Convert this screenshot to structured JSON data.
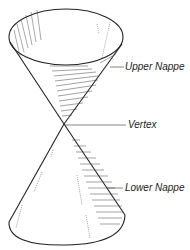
{
  "figure": {
    "labels": {
      "upper_nappe": "Upper Nappe",
      "vertex": "Vertex",
      "lower_nappe": "Lower Nappe"
    },
    "colors": {
      "ink": "#222222",
      "background": "#ffffff"
    }
  }
}
